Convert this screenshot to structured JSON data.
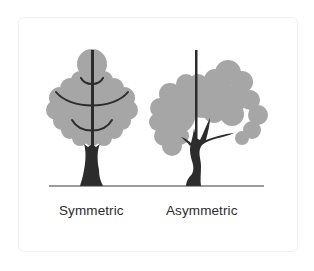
{
  "diagram": {
    "colors": {
      "canopy": "#a6a6a6",
      "trunk": "#2c2c2c",
      "ground": "#3a3a3a",
      "label": "#2b2b2b",
      "card_border": "#f1f1f1"
    },
    "trees": [
      {
        "id": "symmetric",
        "label": "Symmetric"
      },
      {
        "id": "asymmetric",
        "label": "Asymmetric"
      }
    ]
  }
}
